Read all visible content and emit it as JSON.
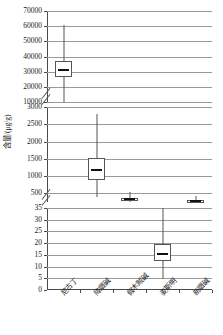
{
  "chart_data": {
    "type": "boxplot",
    "title": "",
    "xlabel": "",
    "ylabel": "含量/(μg/g)",
    "grid": true,
    "legend": null,
    "broken_axis": true,
    "categories": [
      "尼古丁",
      "降烟碱",
      "假木贼碱",
      "麦斯明",
      "新烟碱"
    ],
    "panels": [
      {
        "name": "top",
        "ylim": [
          10000,
          70000
        ],
        "ticks": [
          10000,
          20000,
          30000,
          40000,
          50000,
          60000,
          70000
        ],
        "tick_labels": [
          "10000",
          "20000",
          "30000",
          "40000",
          "50000",
          "60000",
          "70000"
        ]
      },
      {
        "name": "middle",
        "ylim": [
          250,
          3000
        ],
        "ticks": [
          500,
          1000,
          1500,
          2000,
          2500,
          3000
        ],
        "tick_labels": [
          "500",
          "1000",
          "1500",
          "2000",
          "2500",
          "3000"
        ]
      },
      {
        "name": "bottom",
        "ylim": [
          0,
          35
        ],
        "ticks": [
          0,
          5,
          10,
          15,
          20,
          25,
          30,
          35
        ],
        "tick_labels": [
          "0",
          "5",
          "10",
          "15",
          "20",
          "25",
          "30",
          "35"
        ]
      }
    ],
    "boxes": [
      {
        "category": "尼古丁",
        "panel": "top",
        "whisker_low": 9800,
        "q1": 26500,
        "median": 30800,
        "q3": 36800,
        "whisker_high": 60500
      },
      {
        "category": "降烟碱",
        "panel": "middle",
        "whisker_low": 390,
        "q1": 890,
        "median": 1170,
        "q3": 1510,
        "whisker_high": 2800
      },
      {
        "category": "假木贼碱",
        "panel": "middle",
        "whisker_low": 250,
        "q1": 300,
        "median": 330,
        "q3": 380,
        "whisker_high": 530
      },
      {
        "category": "麦斯明",
        "panel": "bottom",
        "whisker_low": 4.8,
        "q1": 12.2,
        "median": 15.2,
        "q3": 19.8,
        "whisker_high": 35.0
      },
      {
        "category": "新烟碱",
        "panel": "middle",
        "whisker_low": 250,
        "q1": 265,
        "median": 280,
        "q3": 300,
        "whisker_high": 430
      }
    ]
  },
  "axis": {
    "break_marker": "axis-break"
  }
}
